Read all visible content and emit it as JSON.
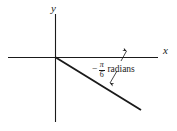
{
  "figure": {
    "background_color": "#ffffff",
    "stroke_color": "#1a1a1a",
    "axes": {
      "x_axis_label": "x",
      "y_axis_label": "y",
      "origin": {
        "x": 55,
        "y": 57
      },
      "x_axis_extent": {
        "x1": 8,
        "y1": 57,
        "x2": 158,
        "y2": 57
      },
      "y_axis_extent": {
        "x1": 55,
        "y1": 14,
        "x2": 55,
        "y2": 122
      }
    },
    "terminal_ray": {
      "from": {
        "x": 55,
        "y": 57
      },
      "to": {
        "x": 141,
        "y": 110
      },
      "description": "terminal side of angle in fourth quadrant"
    },
    "annotation": {
      "minus": "−",
      "numerator": "π",
      "denominator": "6",
      "unit": "radians",
      "full_text": "−π/6 radians",
      "leader_to_axis": {
        "x1": 121,
        "y1": 60,
        "x2": 126,
        "y2": 50
      },
      "leader_to_ray": {
        "x1": 117,
        "y1": 72,
        "x2": 110,
        "y2": 84
      }
    }
  }
}
